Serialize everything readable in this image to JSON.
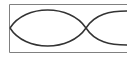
{
  "diagram": {
    "colors": {
      "frame": "#808080",
      "curve": "#333333",
      "background": "#ffffff"
    },
    "frame": {
      "x": 9,
      "y": 4,
      "width": 118,
      "height": 48
    },
    "nodes": [
      {
        "x": 10,
        "y": 28
      },
      {
        "x": 86,
        "y": 28
      }
    ],
    "antinode_amplitude_px": 17
  }
}
